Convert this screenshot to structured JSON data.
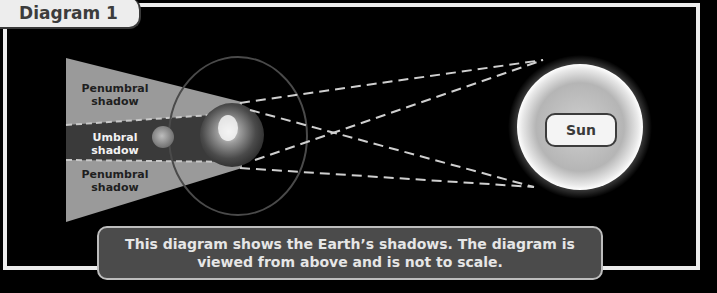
{
  "title": "Diagram 1",
  "labels": {
    "penumbral_top": [
      "Penumbral",
      "shadow"
    ],
    "umbral": [
      "Umbral",
      "shadow"
    ],
    "penumbral_bottom": [
      "Penumbral",
      "shadow"
    ],
    "sun": "Sun"
  },
  "caption": {
    "line1": "This diagram shows the Earth’s shadows. The diagram is",
    "line2": "viewed from above and is not to scale."
  },
  "colors": {
    "background": "#000000",
    "frame": "#ececec",
    "penumbra": "#9a9a9a",
    "umbra": "#3a3a3a",
    "orbit": "#4a4a4a",
    "dashes": "#cfcfcf",
    "caption_bg": "#4b4b4b"
  }
}
